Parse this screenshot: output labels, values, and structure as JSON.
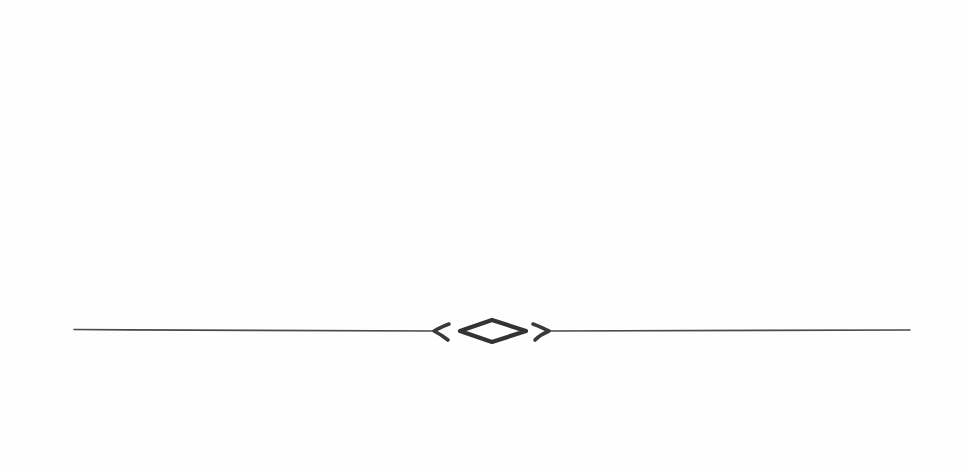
{
  "canvas": {
    "width": 966,
    "height": 468,
    "background": "#fefefe"
  },
  "divider": {
    "description": "Hand-drawn ornamental horizontal divider with central diamond flanked by two chevrons",
    "ink_color": "#3a3a3a",
    "line": {
      "y": 330,
      "left_start_x": 74,
      "left_end_x": 435,
      "right_start_x": 548,
      "right_end_x": 910
    },
    "ornament": {
      "left_chevron_icon": "chevron-left-ornament",
      "center_icon": "hollow-diamond-ornament",
      "right_chevron_icon": "chevron-right-ornament",
      "diamond_center": [
        493,
        331
      ]
    }
  }
}
